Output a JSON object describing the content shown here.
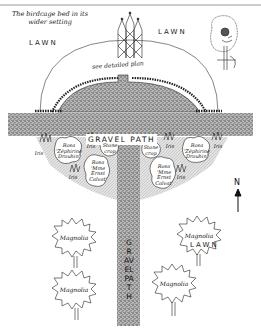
{
  "caption": {
    "line1": "The birdcage bed in its",
    "line2": "wider setting"
  },
  "labels": {
    "lawn_top_left": "LAWN",
    "lawn_top_right": "LAWN",
    "lawn_bottom_right": "LAWN",
    "see_plan": "see detailed plan",
    "gravel_path_horizontal": "GRAVEL PATH",
    "gravel_path_vertical": "GRAVEL PATH",
    "north": "N"
  },
  "beds": {
    "left": [
      {
        "name": "Iris",
        "x": 38,
        "y": 150
      },
      {
        "name": "Rosa 'Zéphirine Drouhin'",
        "x": 62,
        "y": 148
      },
      {
        "name": "Iris",
        "x": 88,
        "y": 144
      },
      {
        "name": "Stonecrop",
        "x": 110,
        "y": 152
      },
      {
        "name": "Rosa 'Mme Ernst Calvat'",
        "x": 96,
        "y": 172
      },
      {
        "name": "Iris",
        "x": 72,
        "y": 176
      }
    ],
    "right": [
      {
        "name": "Stonecrop",
        "x": 150,
        "y": 150
      },
      {
        "name": "Iris",
        "x": 168,
        "y": 146
      },
      {
        "name": "Rosa 'Zéphirine Drouhin'",
        "x": 193,
        "y": 148
      },
      {
        "name": "Iris",
        "x": 216,
        "y": 144
      },
      {
        "name": "Rosa 'Mme Ernst Calvat'",
        "x": 163,
        "y": 172
      },
      {
        "name": "Iris",
        "x": 180,
        "y": 176
      }
    ]
  },
  "trees": [
    {
      "name": "Magnolia",
      "x": 75,
      "y": 240
    },
    {
      "name": "Magnolia",
      "x": 200,
      "y": 238
    },
    {
      "name": "Magnolia",
      "x": 75,
      "y": 292
    },
    {
      "name": "Magnolia",
      "x": 175,
      "y": 286
    }
  ],
  "colors": {
    "ink": "#1a1a1a",
    "gravel": "#8a8a8a",
    "border_line": "#9a9a9a",
    "bed_shade": "#d4d4d4"
  }
}
